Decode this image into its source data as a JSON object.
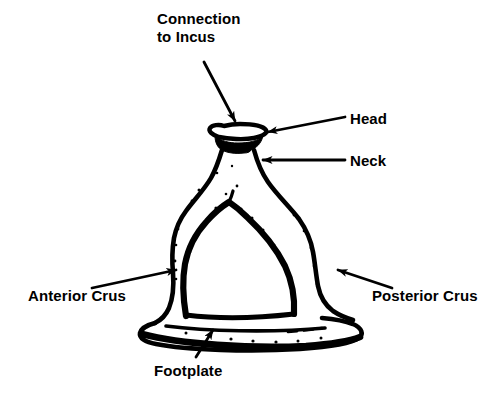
{
  "figure": {
    "background_color": "#ffffff",
    "ink_color": "#000000",
    "width": 502,
    "height": 412
  },
  "labels": {
    "connection_to_incus": "Connection\nto Incus",
    "head": "Head",
    "neck": "Neck",
    "anterior_crus": "Anterior Crus",
    "posterior_crus": "Posterior Crus",
    "footplate": "Footplate"
  },
  "callouts": [
    {
      "name": "connection-to-incus",
      "label": "Connection\nto Incus",
      "label_x": 157,
      "label_y": 10,
      "line_from": [
        204,
        62
      ],
      "line_to": [
        235,
        124
      ],
      "arrow_direction": "down-right"
    },
    {
      "name": "head",
      "label": "Head",
      "label_x": 350,
      "label_y": 110,
      "line_from": [
        345,
        117
      ],
      "line_to": [
        266,
        133
      ],
      "arrow_direction": "left"
    },
    {
      "name": "neck",
      "label": "Neck",
      "label_x": 350,
      "label_y": 152,
      "line_from": [
        345,
        160
      ],
      "line_to": [
        261,
        160
      ],
      "arrow_direction": "left"
    },
    {
      "name": "anterior-crus",
      "label": "Anterior Crus",
      "label_x": 28,
      "label_y": 287,
      "line_from": [
        92,
        288
      ],
      "line_to": [
        177,
        270
      ],
      "arrow_direction": "up-right"
    },
    {
      "name": "posterior-crus",
      "label": "Posterior Crus",
      "label_x": 372,
      "label_y": 287,
      "line_from": [
        392,
        288
      ],
      "line_to": [
        337,
        270
      ],
      "arrow_direction": "up-left"
    },
    {
      "name": "footplate",
      "label": "Footplate",
      "label_x": 154,
      "label_y": 362,
      "line_from": [
        196,
        358
      ],
      "line_to": [
        212,
        331
      ],
      "arrow_direction": "up-right"
    }
  ],
  "parts": [
    {
      "name": "head",
      "description": "flattened oval cap at top of bone"
    },
    {
      "name": "neck",
      "description": "narrow waist below the head"
    },
    {
      "name": "anterior-crus",
      "description": "left limb of the arch"
    },
    {
      "name": "posterior-crus",
      "description": "right limb of the arch"
    },
    {
      "name": "obturator-foramen",
      "description": "central arched opening between the crura"
    },
    {
      "name": "footplate",
      "description": "wide flat base plate"
    }
  ]
}
